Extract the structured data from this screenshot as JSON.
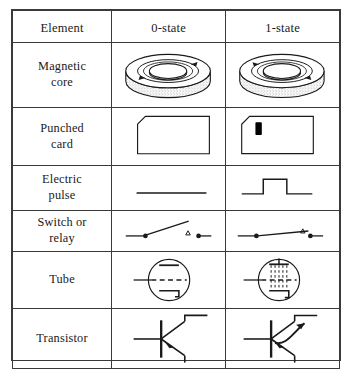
{
  "table": {
    "headers": [
      "Element",
      "0-state",
      "1-state"
    ],
    "rows": [
      {
        "element": "Magnetic core",
        "element_lines": [
          "Magnetic",
          "core"
        ],
        "zero_state": "toroid-core-clockwise-flux",
        "one_state": "toroid-core-counterclockwise-flux"
      },
      {
        "element": "Punched card",
        "element_lines": [
          "Punched",
          "card"
        ],
        "zero_state": "card-no-hole",
        "one_state": "card-with-punched-hole"
      },
      {
        "element": "Electric pulse",
        "element_lines": [
          "Electric",
          "pulse"
        ],
        "zero_state": "flat-line-no-pulse",
        "one_state": "square-pulse"
      },
      {
        "element": "Switch or relay",
        "element_lines": [
          "Switch  or",
          "relay"
        ],
        "zero_state": "switch-open",
        "one_state": "switch-closed"
      },
      {
        "element": "Tube",
        "element_lines": [
          "Tube"
        ],
        "zero_state": "vacuum-tube-not-conducting",
        "one_state": "vacuum-tube-conducting"
      },
      {
        "element": "Transistor",
        "element_lines": [
          "Transistor"
        ],
        "zero_state": "transistor-no-current",
        "one_state": "transistor-current-flow"
      }
    ]
  },
  "colors": {
    "ink": "#1a1a1a",
    "border": "#3a3a3a",
    "background": "#ffffff",
    "hole_fill": "#000000"
  }
}
